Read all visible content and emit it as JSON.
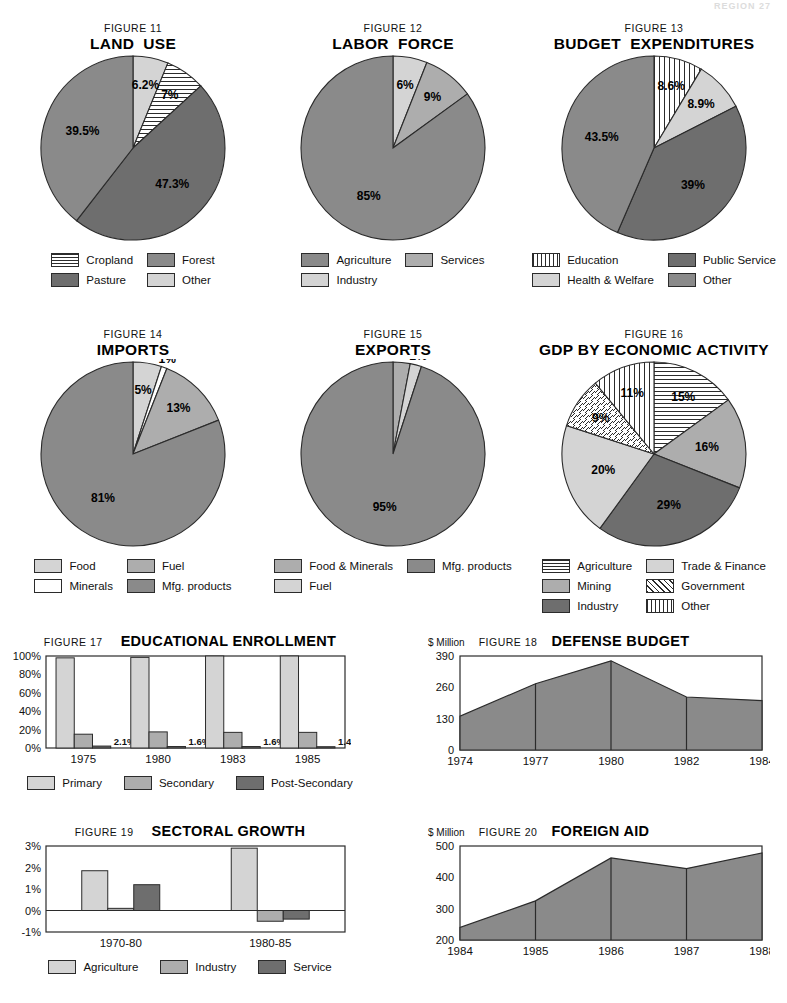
{
  "header": {
    "text": "REGION  27"
  },
  "palette": {
    "dark": "#6e6e6e",
    "mid": "#8a8a8a",
    "light": "#adadad",
    "xlight": "#d4d4d4",
    "white": "#ffffff",
    "stroke": "#2b2b2b"
  },
  "chart_data": [
    {
      "id": "figure-11",
      "type": "pie",
      "figure_number": "FIGURE 11",
      "title": "LAND  USE",
      "categories": [
        "Other",
        "Cropland",
        "Pasture",
        "Forest"
      ],
      "values": [
        6.2,
        7,
        47.3,
        39.5
      ],
      "value_labels": [
        "6.2%",
        "7%",
        "47.3%",
        "39.5%"
      ],
      "fills": [
        "xlight",
        "hstripe",
        "dark",
        "mid"
      ],
      "legend": [
        {
          "label": "Cropland",
          "fill": "hstripe"
        },
        {
          "label": "Forest",
          "fill": "mid"
        },
        {
          "label": "Pasture",
          "fill": "dark"
        },
        {
          "label": "Other",
          "fill": "xlight"
        }
      ],
      "start_angle": 0
    },
    {
      "id": "figure-12",
      "type": "pie",
      "figure_number": "FIGURE 12",
      "title": "LABOR  FORCE",
      "categories": [
        "Industry",
        "Services",
        "Agriculture"
      ],
      "values": [
        6,
        9,
        85
      ],
      "value_labels": [
        "6%",
        "9%",
        "85%"
      ],
      "fills": [
        "xlight",
        "light",
        "mid"
      ],
      "legend": [
        {
          "label": "Agriculture",
          "fill": "mid"
        },
        {
          "label": "Services",
          "fill": "light"
        },
        {
          "label": "Industry",
          "fill": "xlight"
        }
      ],
      "start_angle": 0
    },
    {
      "id": "figure-13",
      "type": "pie",
      "figure_number": "FIGURE 13",
      "title": "BUDGET  EXPENDITURES",
      "categories": [
        "Education",
        "Health & Welfare",
        "Public Service",
        "Other"
      ],
      "values": [
        8.6,
        8.9,
        39,
        43.5
      ],
      "value_labels": [
        "8.6%",
        "8.9%",
        "39%",
        "43.5%"
      ],
      "fills": [
        "vstripe",
        "xlight",
        "dark",
        "mid"
      ],
      "legend": [
        {
          "label": "Education",
          "fill": "vstripe"
        },
        {
          "label": "Public Service",
          "fill": "dark"
        },
        {
          "label": "Health & Welfare",
          "fill": "xlight"
        },
        {
          "label": "Other",
          "fill": "mid"
        }
      ],
      "start_angle": 0
    },
    {
      "id": "figure-14",
      "type": "pie",
      "figure_number": "FIGURE 14",
      "title": "IMPORTS",
      "categories": [
        "Food",
        "Minerals",
        "Fuel",
        "Mfg. products"
      ],
      "values": [
        5,
        1,
        13,
        81
      ],
      "value_labels": [
        "5%",
        "1%",
        "13%",
        "81%"
      ],
      "fills": [
        "xlight",
        "white",
        "light",
        "mid"
      ],
      "legend": [
        {
          "label": "Food",
          "fill": "xlight"
        },
        {
          "label": "Fuel",
          "fill": "light"
        },
        {
          "label": "Minerals",
          "fill": "white"
        },
        {
          "label": "Mfg. products",
          "fill": "mid"
        }
      ],
      "start_angle": 0
    },
    {
      "id": "figure-15",
      "type": "pie",
      "figure_number": "FIGURE 15",
      "title": "EXPORTS",
      "categories": [
        "Food & Minerals",
        "Fuel",
        "Mfg. products"
      ],
      "values": [
        3,
        2,
        95
      ],
      "value_labels": [
        "3%",
        "2%",
        "95%"
      ],
      "fills": [
        "light",
        "xlight",
        "mid"
      ],
      "legend": [
        {
          "label": "Food & Minerals",
          "fill": "light"
        },
        {
          "label": "Mfg. products",
          "fill": "mid"
        },
        {
          "label": "Fuel",
          "fill": "xlight"
        }
      ],
      "start_angle": 0
    },
    {
      "id": "figure-16",
      "type": "pie",
      "figure_number": "FIGURE 16",
      "title": "GDP BY ECONOMIC ACTIVITY",
      "categories": [
        "Agriculture",
        "Mining",
        "Industry",
        "Trade & Finance",
        "Government",
        "Other"
      ],
      "values": [
        15,
        16,
        29,
        20,
        9,
        11
      ],
      "value_labels": [
        "15%",
        "16%",
        "29%",
        "20%",
        "9%",
        "11%"
      ],
      "fills": [
        "hstripe",
        "light",
        "dark",
        "xlight",
        "dstripe",
        "vstripe"
      ],
      "legend": [
        {
          "label": "Agriculture",
          "fill": "hstripe"
        },
        {
          "label": "Trade & Finance",
          "fill": "xlight"
        },
        {
          "label": "Mining",
          "fill": "light"
        },
        {
          "label": "Government",
          "fill": "dstripe"
        },
        {
          "label": "Industry",
          "fill": "dark"
        },
        {
          "label": "Other",
          "fill": "vstripe"
        }
      ],
      "start_angle": 0
    },
    {
      "id": "figure-17",
      "type": "bar",
      "figure_number": "FIGURE 17",
      "title": "EDUCATIONAL ENROLLMENT",
      "categories": [
        "1975",
        "1980",
        "1983",
        "1985"
      ],
      "ylabel": "",
      "ylim": [
        0,
        100
      ],
      "yticks": [
        0,
        20,
        40,
        60,
        80,
        100
      ],
      "ytick_labels": [
        "0%",
        "20%",
        "40%",
        "60%",
        "80%",
        "100%"
      ],
      "series": [
        {
          "name": "Primary",
          "fill": "xlight",
          "values": [
            98,
            98.5,
            100,
            100
          ]
        },
        {
          "name": "Secondary",
          "fill": "light",
          "values": [
            15,
            17.5,
            17,
            17
          ]
        },
        {
          "name": "Post-Secondary",
          "fill": "dark",
          "values": [
            2.1,
            1.6,
            1.6,
            1.4
          ],
          "data_labels": [
            "2.1%",
            "1.6%",
            "1.6%",
            "1.4%"
          ]
        }
      ]
    },
    {
      "id": "figure-18",
      "type": "area",
      "figure_number": "FIGURE 18",
      "title": "DEFENSE BUDGET",
      "unit": "$ Million",
      "x": [
        "1974",
        "1977",
        "1980",
        "1982",
        "1984"
      ],
      "values": [
        140,
        275,
        370,
        220,
        205
      ],
      "ylim": [
        0,
        390
      ],
      "yticks": [
        0,
        130,
        260,
        390
      ],
      "ytick_labels": [
        "0",
        "130",
        "260",
        "390"
      ],
      "fill": "mid"
    },
    {
      "id": "figure-19",
      "type": "bar",
      "figure_number": "FIGURE 19",
      "title": "SECTORAL GROWTH",
      "categories": [
        "1970-80",
        "1980-85"
      ],
      "ylim": [
        -1,
        3
      ],
      "yticks": [
        -1,
        0,
        1,
        2,
        3
      ],
      "ytick_labels": [
        "-1%",
        "0%",
        "1%",
        "2%",
        "3%"
      ],
      "series": [
        {
          "name": "Agriculture",
          "fill": "xlight",
          "values": [
            1.85,
            2.9
          ]
        },
        {
          "name": "Industry",
          "fill": "light",
          "values": [
            0.1,
            -0.5
          ],
          "data_labels": [
            ".1%",
            ""
          ]
        },
        {
          "name": "Service",
          "fill": "dark",
          "values": [
            1.2,
            -0.4
          ]
        }
      ]
    },
    {
      "id": "figure-20",
      "type": "area",
      "figure_number": "FIGURE 20",
      "title": "FOREIGN AID",
      "unit": "$ Million",
      "x": [
        "1984",
        "1985",
        "1986",
        "1987",
        "1988"
      ],
      "values": [
        240,
        325,
        462,
        428,
        478
      ],
      "ylim": [
        200,
        500
      ],
      "yticks": [
        200,
        300,
        400,
        500
      ],
      "ytick_labels": [
        "200",
        "300",
        "400",
        "500"
      ],
      "fill": "mid"
    }
  ]
}
